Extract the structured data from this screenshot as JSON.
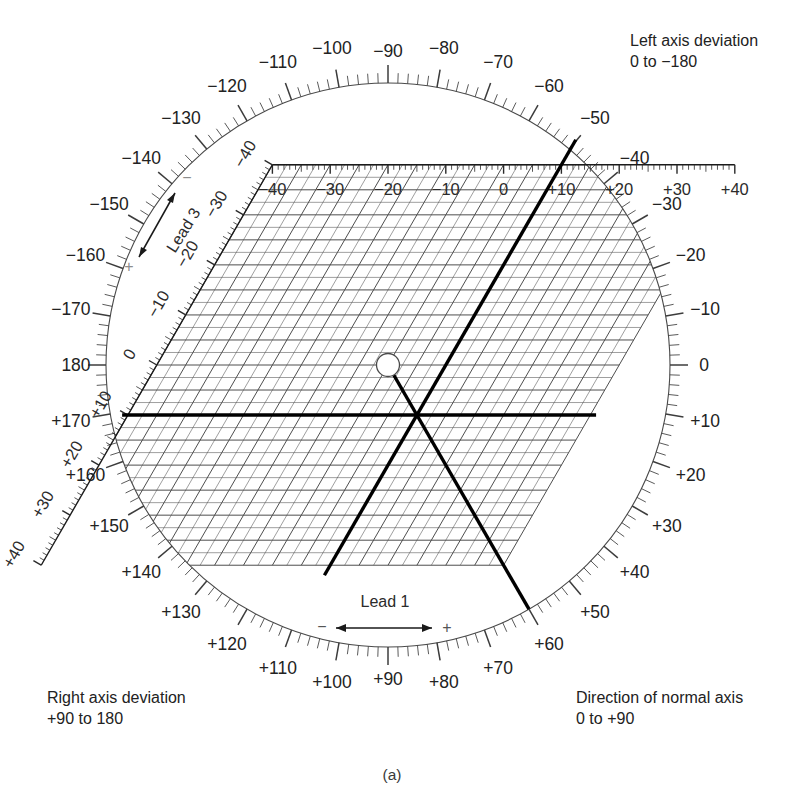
{
  "figure": {
    "caption": "(a)"
  },
  "corner_notes": {
    "top_right": {
      "line1": "Left axis deviation",
      "line2": "0 to −180"
    },
    "bottom_left": {
      "line1": "Right axis deviation",
      "line2": "+90 to 180"
    },
    "bottom_right": {
      "line1": "Direction of normal axis",
      "line2": "0 to +90"
    }
  },
  "leads": {
    "lead1": {
      "name": "Lead 1",
      "minus_sign": "−",
      "plus_sign": "+",
      "ticks": [
        "−40",
        "−30",
        "−20",
        "−10",
        "0",
        "+10",
        "+20",
        "+30",
        "+40"
      ],
      "tick_values": [
        -40,
        -30,
        -20,
        -10,
        0,
        10,
        20,
        30,
        40
      ]
    },
    "lead3": {
      "name": "Lead 3",
      "minus_sign": "−",
      "plus_sign": "+",
      "ticks": [
        "−40",
        "−30",
        "−20",
        "−10",
        "0",
        "+10",
        "+20",
        "+30",
        "+40"
      ],
      "tick_values": [
        -40,
        -30,
        -20,
        -10,
        0,
        10,
        20,
        30,
        40
      ]
    }
  },
  "degree_scale": {
    "labels": [
      "0",
      "−10",
      "−20",
      "−30",
      "−40",
      "−50",
      "−60",
      "−70",
      "−80",
      "−90",
      "−100",
      "−110",
      "−120",
      "−130",
      "−140",
      "−150",
      "−160",
      "−170",
      "180",
      "+170",
      "+160",
      "+150",
      "+140",
      "+130",
      "+120",
      "+110",
      "+100",
      "+90",
      "+80",
      "+70",
      "+60",
      "+50",
      "+40",
      "+30",
      "+20",
      "+10"
    ],
    "values": [
      0,
      -10,
      -20,
      -30,
      -40,
      -50,
      -60,
      -70,
      -80,
      -90,
      -100,
      -110,
      -120,
      -130,
      -140,
      -150,
      -160,
      -170,
      180,
      170,
      160,
      150,
      140,
      130,
      120,
      110,
      100,
      90,
      80,
      70,
      60,
      50,
      40,
      30,
      20,
      10
    ],
    "minor_tick_step_deg": 2
  },
  "chart_data": {
    "type": "scatter",
    "xlabel": "Lead 1",
    "ylabel": "Lead 3",
    "xlim": [
      -40,
      40
    ],
    "ylim": [
      -40,
      40
    ],
    "grid": true,
    "annotations": [
      {
        "name": "origin-marker",
        "label": "open circle at grid origin",
        "x": 0,
        "y": 0
      },
      {
        "name": "lead1-perpendicular",
        "label": "Lead 1 net deflection = +10",
        "value": 10
      },
      {
        "name": "lead3-perpendicular",
        "label": "Lead 3 net deflection = +10",
        "value": 10
      },
      {
        "name": "resultant-axis",
        "label": "Resultant mean frontal axis ≈ +60°",
        "value": 60
      }
    ]
  },
  "colors": {
    "ink": "#1a1a1a",
    "grid": "#555555",
    "thick": "#000000",
    "paper": "#ffffff"
  }
}
